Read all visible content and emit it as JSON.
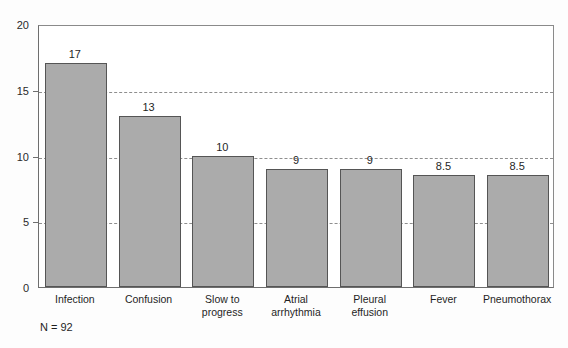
{
  "chart_data": {
    "type": "bar",
    "title": "",
    "subtitle": "",
    "xlabel": "",
    "ylabel": "",
    "ylim": [
      0,
      20
    ],
    "yticks": [
      0,
      5,
      10,
      15,
      20
    ],
    "grid": "horizontal-dashed",
    "legend": "none",
    "categories": [
      "Infection",
      "Confusion",
      "Slow to progress",
      "Atrial arrhythmia",
      "Pleural effusion",
      "Fever",
      "Pneumothorax"
    ],
    "category_lines": [
      [
        "Infection"
      ],
      [
        "Confusion"
      ],
      [
        "Slow to",
        "progress"
      ],
      [
        "Atrial",
        "arrhythmia"
      ],
      [
        "Pleural",
        "effusion"
      ],
      [
        "Fever"
      ],
      [
        "Pneumothorax"
      ]
    ],
    "values": [
      17,
      13,
      10,
      9,
      9,
      8.5,
      8.5
    ],
    "value_labels": [
      "17",
      "13",
      "10",
      "9",
      "9",
      "8.5",
      "8.5"
    ],
    "annotations": [
      "N = 92"
    ],
    "colors": {
      "bar_fill": "#ababab",
      "bar_edge": "#555555",
      "axis": "#6e6e6e",
      "grid": "#8e8e8e",
      "text": "#1f1f1f",
      "background": "#fdfdfd"
    }
  },
  "axis": {
    "y_tick_labels": [
      "0",
      "5",
      "10",
      "15",
      "20"
    ]
  },
  "footnote": {
    "text": "N = 92"
  }
}
